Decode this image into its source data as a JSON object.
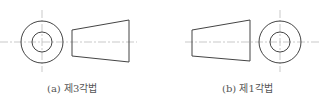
{
  "figure": {
    "panels": [
      {
        "id": "a",
        "caption": "(a) 제3각법",
        "layout": "circle-view left, trapezoid-view right"
      },
      {
        "id": "b",
        "caption": "(b) 제1각법",
        "layout": "trapezoid-view left, circle-view right"
      }
    ],
    "colors": {
      "outline": "#444444",
      "centerline": "#bbbbbb",
      "caption": "#555555"
    }
  }
}
